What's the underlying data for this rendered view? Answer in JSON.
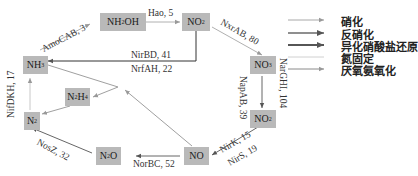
{
  "nodes": {
    "nh2oh": {
      "label": "NH2OH",
      "main": "NH",
      "sub": "2",
      "tail": "OH"
    },
    "no2_top": {
      "label": "NO2",
      "main": "NO",
      "sub": "2"
    },
    "nh3": {
      "label": "NH3",
      "main": "NH",
      "sub": "3"
    },
    "no3": {
      "label": "NO3",
      "main": "NO",
      "sub": "3"
    },
    "n2h4": {
      "label": "N2H4",
      "main": "N",
      "sub": "2",
      "tail": "H",
      "sub2": "4"
    },
    "n2": {
      "label": "N2",
      "main": "N",
      "sub": "2"
    },
    "no2_right": {
      "label": "NO2",
      "main": "NO",
      "sub": "2"
    },
    "n2o": {
      "label": "N2O",
      "main": "N",
      "sub": "2",
      "tail": "O"
    },
    "no": {
      "label": "NO",
      "main": "NO"
    }
  },
  "edges": [
    {
      "from": "NH3",
      "to": "NH2OH",
      "label": "AmoCAB, 3",
      "process": "nitrification"
    },
    {
      "from": "NH2OH",
      "to": "NO2",
      "label": "Hao, 5",
      "process": "nitrification"
    },
    {
      "from": "NO2",
      "to": "NO3",
      "label": "NxrAB, 80",
      "process": "nitrification"
    },
    {
      "from": "NO2",
      "to": "NH3",
      "label": "NirBD, 41",
      "process": "dnra"
    },
    {
      "from": "NO2",
      "to": "NH3",
      "label": "NrfAH, 22",
      "process": "dnra"
    },
    {
      "from": "NO3",
      "to": "NO2",
      "label": "NapAB, 39",
      "process": "denitrification"
    },
    {
      "from": "NO3",
      "to": "NO2",
      "label": "NarGHI, 104",
      "process": "denitrification"
    },
    {
      "from": "NO2",
      "to": "NO",
      "label": "NirK, 15",
      "process": "denitrification"
    },
    {
      "from": "NO2",
      "to": "NO",
      "label": "NirS, 19",
      "process": "denitrification"
    },
    {
      "from": "NO",
      "to": "N2O",
      "label": "NorBC, 52",
      "process": "denitrification"
    },
    {
      "from": "N2O",
      "to": "N2",
      "label": "NosZ, 32",
      "process": "denitrification"
    },
    {
      "from": "N2",
      "to": "NH3",
      "label": "NifDKH, 17",
      "process": "nitrogen_fixation"
    },
    {
      "from": "NO",
      "to": "N2H4",
      "label": "",
      "process": "anammox"
    },
    {
      "from": "NH3",
      "to": "N2H4",
      "label": "",
      "process": "anammox"
    },
    {
      "from": "N2H4",
      "to": "N2",
      "label": "",
      "process": "anammox"
    }
  ],
  "edge_labels": {
    "amocab": "AmoCAB, 3",
    "hao": "Hao, 5",
    "nxrab": "NxrAB, 80",
    "nirbd": "NirBD, 41",
    "nrfah": "NrfAH, 22",
    "napab": "NapAB, 39",
    "nargh": "NarGHI, 104",
    "nirk": "NirK, 15",
    "nirs": "NirS, 19",
    "norbc": "NorBC, 52",
    "nosz": "NosZ, 32",
    "nifdkh": "NifDKH, 17"
  },
  "legend": {
    "items": [
      {
        "label": "硝化",
        "meaning": "nitrification",
        "color": "#9a9a9a"
      },
      {
        "label": "反硝化",
        "meaning": "denitrification",
        "color": "#6a6a6a"
      },
      {
        "label": "异化硝酸盐还原",
        "meaning": "dissimilatory nitrate reduction",
        "color": "#1e1e1e"
      },
      {
        "label": "氮固定",
        "meaning": "nitrogen fixation",
        "color": "#cfcfcf"
      },
      {
        "label": "厌氧氨氧化",
        "meaning": "anammox",
        "color": "#8a8a8a"
      }
    ]
  },
  "colors": {
    "node_fill": "#b9b9b9",
    "text": "#222222"
  }
}
